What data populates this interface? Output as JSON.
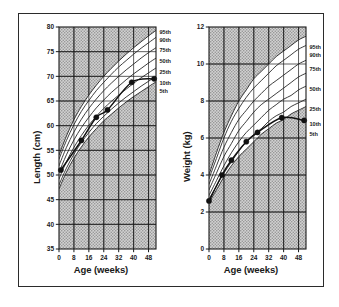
{
  "figure": {
    "border_color": "#2b2b2b",
    "background": "#ffffff",
    "plot_fill": "#c8c8c8",
    "line_color": "#1a1a1a",
    "marker_color": "#111111"
  },
  "chart_data": [
    {
      "type": "line",
      "id": "length-for-age",
      "title": "",
      "xlabel": "Age (weeks)",
      "ylabel": "Length (cm)",
      "xlim": [
        0,
        52
      ],
      "ylim": [
        35,
        80
      ],
      "xticks": [
        0,
        8,
        16,
        24,
        32,
        40,
        48
      ],
      "yticks": [
        35,
        40,
        45,
        50,
        55,
        60,
        65,
        70,
        75,
        80
      ],
      "grid": true,
      "legend_position": "right-outside",
      "x": [
        0,
        4,
        8,
        12,
        16,
        20,
        24,
        28,
        32,
        36,
        40,
        44,
        48,
        52
      ],
      "series": [
        {
          "name": "95th",
          "values": [
            54.0,
            57.9,
            61.2,
            63.9,
            66.2,
            68.2,
            70.0,
            71.6,
            73.1,
            74.5,
            75.8,
            77.0,
            78.2,
            79.3
          ]
        },
        {
          "name": "90th",
          "values": [
            53.2,
            57.0,
            60.2,
            62.9,
            65.1,
            67.1,
            68.8,
            70.4,
            71.9,
            73.2,
            74.5,
            75.7,
            76.8,
            77.9
          ]
        },
        {
          "name": "75th",
          "values": [
            51.9,
            55.6,
            58.7,
            61.3,
            63.5,
            65.4,
            67.1,
            68.6,
            70.0,
            71.3,
            72.5,
            73.7,
            74.8,
            75.8
          ]
        },
        {
          "name": "50th",
          "values": [
            50.5,
            54.1,
            57.1,
            59.6,
            61.7,
            63.6,
            65.2,
            66.7,
            68.0,
            69.3,
            70.5,
            71.6,
            72.7,
            73.7
          ]
        },
        {
          "name": "25th",
          "values": [
            49.2,
            52.7,
            55.6,
            58.0,
            60.1,
            61.9,
            63.5,
            64.9,
            66.2,
            67.4,
            68.6,
            69.7,
            70.7,
            71.7
          ]
        },
        {
          "name": "10th",
          "values": [
            48.0,
            51.4,
            54.2,
            56.6,
            58.6,
            60.4,
            61.9,
            63.3,
            64.6,
            65.8,
            66.9,
            68.0,
            69.0,
            70.0
          ]
        },
        {
          "name": "5th",
          "values": [
            47.2,
            50.6,
            53.4,
            55.7,
            57.7,
            59.4,
            61.0,
            62.3,
            63.6,
            64.8,
            65.9,
            66.9,
            67.9,
            68.9
          ]
        }
      ],
      "patient_points": {
        "name": "patient-measurements",
        "x": [
          1,
          12,
          20,
          26,
          39,
          51
        ],
        "y": [
          51.0,
          57.0,
          61.7,
          63.2,
          68.8,
          69.5
        ]
      },
      "patient_line": {
        "x": [
          1,
          12,
          20,
          26,
          39,
          51
        ],
        "y": [
          51.0,
          57.0,
          61.7,
          63.2,
          68.8,
          69.5
        ]
      }
    },
    {
      "type": "line",
      "id": "weight-for-age",
      "title": "",
      "xlabel": "Age (weeks)",
      "ylabel": "Weight (kg)",
      "xlim": [
        0,
        52
      ],
      "ylim": [
        0,
        12
      ],
      "xticks": [
        0,
        8,
        16,
        24,
        32,
        40,
        48
      ],
      "yticks": [
        0,
        2,
        4,
        6,
        8,
        10,
        12
      ],
      "grid": true,
      "legend_position": "right-outside",
      "x": [
        0,
        4,
        8,
        12,
        16,
        20,
        24,
        28,
        32,
        36,
        40,
        44,
        48,
        52
      ],
      "series": [
        {
          "name": "95th",
          "values": [
            4.0,
            5.2,
            6.3,
            7.2,
            8.0,
            8.6,
            9.2,
            9.6,
            10.0,
            10.4,
            10.7,
            11.0,
            11.3,
            11.5
          ]
        },
        {
          "name": "90th",
          "values": [
            3.8,
            4.9,
            6.0,
            6.9,
            7.6,
            8.2,
            8.7,
            9.1,
            9.5,
            9.9,
            10.2,
            10.5,
            10.8,
            11.0
          ]
        },
        {
          "name": "75th",
          "values": [
            3.5,
            4.5,
            5.5,
            6.3,
            7.0,
            7.5,
            8.0,
            8.4,
            8.8,
            9.1,
            9.4,
            9.7,
            10.0,
            10.2
          ]
        },
        {
          "name": "50th",
          "values": [
            3.2,
            4.1,
            5.0,
            5.7,
            6.4,
            6.9,
            7.4,
            7.8,
            8.1,
            8.4,
            8.7,
            9.0,
            9.3,
            9.5
          ]
        },
        {
          "name": "25th",
          "values": [
            2.9,
            3.7,
            4.5,
            5.2,
            5.8,
            6.3,
            6.7,
            7.1,
            7.5,
            7.8,
            8.1,
            8.3,
            8.6,
            8.8
          ]
        },
        {
          "name": "10th",
          "values": [
            2.7,
            3.4,
            4.1,
            4.7,
            5.3,
            5.8,
            6.2,
            6.5,
            6.9,
            7.2,
            7.4,
            7.7,
            7.9,
            8.1
          ]
        },
        {
          "name": "5th",
          "values": [
            2.5,
            3.2,
            3.9,
            4.5,
            5.0,
            5.4,
            5.8,
            6.2,
            6.5,
            6.8,
            7.0,
            7.3,
            7.5,
            7.7
          ]
        }
      ],
      "patient_points": {
        "name": "patient-measurements",
        "x": [
          0,
          7,
          12,
          20,
          26,
          39,
          51
        ],
        "y": [
          2.6,
          4.0,
          4.8,
          5.8,
          6.3,
          7.1,
          6.95
        ]
      },
      "patient_line": {
        "x": [
          0,
          7,
          12,
          20,
          26,
          39,
          51
        ],
        "y": [
          2.6,
          4.0,
          4.8,
          5.8,
          6.3,
          7.1,
          6.95
        ]
      }
    }
  ]
}
